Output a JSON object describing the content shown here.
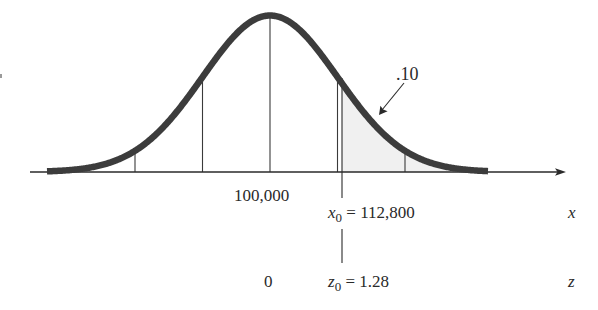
{
  "figure": {
    "colors": {
      "curve": "#3c3c3c",
      "axis": "#2a2a2a",
      "guide_lines": "#3a3a3a",
      "shade": "#efefef",
      "text": "#2a2a2a"
    },
    "tail_area_label": ".10",
    "x_axis": {
      "mean_label": "100,000",
      "x0_symbol": "x",
      "x0_subscript": "0",
      "x0_value_text": " = 112,800",
      "axis_var": "x"
    },
    "z_axis": {
      "mean_label": "0",
      "z0_symbol": "z",
      "z0_subscript": "0",
      "z0_value_text": " = 1.28",
      "axis_var": "z"
    },
    "parameters": {
      "mean": 100000,
      "x0": 112800,
      "z0": 1.28,
      "upper_tail_probability": 0.1
    }
  }
}
